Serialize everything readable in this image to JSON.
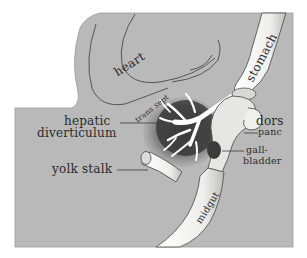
{
  "figure": {
    "type": "anatomical illustration",
    "colors": {
      "background": "#ffffff",
      "panel": "#b9b9b9",
      "organ_light": "#f4f4f2",
      "organ_shade": "#8a8a8a",
      "liver_dark": "#3a3a3a",
      "ink": "#2a2a2a"
    }
  },
  "labels": {
    "heart": "heart",
    "trans_sept": "trans sept",
    "stomach": "stomach",
    "hepatic_1": "hepatic",
    "hepatic_2": "diverticulum",
    "dors_1": "dors",
    "dors_2": "panc",
    "gall_1": "gall-",
    "gall_2": "bladder",
    "yolk_stalk": "yolk stalk",
    "midgut": "midgut"
  }
}
